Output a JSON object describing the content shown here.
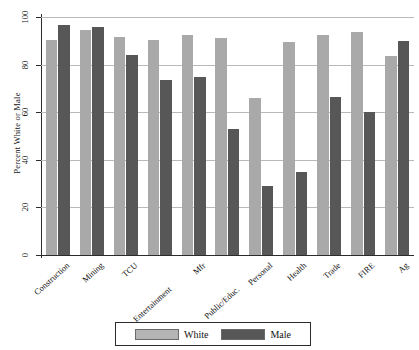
{
  "chart_data": {
    "type": "bar",
    "title": "",
    "xlabel": "",
    "ylabel": "Percent White or Male",
    "ylim": [
      0,
      100
    ],
    "yticks": [
      0,
      20,
      40,
      60,
      80,
      100
    ],
    "grid": true,
    "legend_position": "bottom",
    "categories": [
      "Construction",
      "Mining",
      "TCU",
      "Entertainment",
      "Mfr",
      "Public/Educ.",
      "Personal",
      "Health",
      "Trade",
      "FIRE",
      "Ag"
    ],
    "series": [
      {
        "name": "White",
        "color": "#a9a9a9",
        "values": [
          90.5,
          94.5,
          91.5,
          90.5,
          92.5,
          91.0,
          66.0,
          89.5,
          92.5,
          93.5,
          83.5
        ]
      },
      {
        "name": "Male",
        "color": "#575757",
        "values": [
          96.5,
          96.0,
          84.0,
          73.5,
          75.0,
          53.0,
          29.0,
          35.0,
          66.5,
          60.0,
          90.0
        ]
      }
    ]
  },
  "axis": {
    "y_title": "Percent White or Male",
    "y_ticks": [
      "0",
      "20",
      "40",
      "60",
      "80",
      "100"
    ]
  },
  "legend": {
    "items": [
      {
        "label": "White",
        "swatch": "white-swatch"
      },
      {
        "label": "Male",
        "swatch": "male-swatch"
      }
    ]
  },
  "colors": {
    "white_series": "#a9a9a9",
    "male_series": "#575757",
    "axis": "#2b2b2b",
    "grid": "#b9b9b9",
    "background": "#ffffff"
  }
}
